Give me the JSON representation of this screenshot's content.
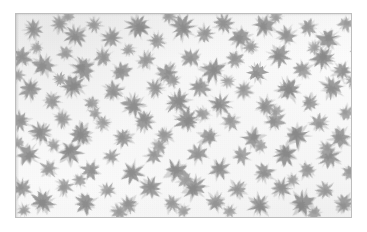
{
  "image": {
    "kind": "micrograph",
    "modality": "brightfield-light-microscopy",
    "color_mode": "grayscale",
    "alt_text": "Grayscale micrograph showing numerous scattered stellate, spiky-edged cells on a pale background",
    "width_px": 367,
    "height_px": 232
  },
  "frame": {
    "border_color": "#bdbdbd",
    "margin_color": "#ffffff",
    "left_px": 15,
    "top_px": 13,
    "width_px": 337,
    "height_px": 205
  },
  "palette": {
    "background": "#fdfdfd",
    "cell_light": "#c9c9c9",
    "cell_mid": "#a8a8a8",
    "cell_dark": "#8d8d8d",
    "cell_core": "#787878",
    "border": "#bdbdbd",
    "paper": "#ffffff"
  },
  "field": {
    "object_label": "cell",
    "object_count": 138,
    "distribution": "scattered",
    "mean_diameter_px": 14,
    "min_diameter_px": 7,
    "max_diameter_px": 24
  },
  "chart_data": {
    "type": "scatter",
    "title": "",
    "xlabel": "",
    "ylabel": "",
    "xlim": [
      0,
      337
    ],
    "ylim": [
      0,
      205
    ],
    "grid": false,
    "legend": "none",
    "series": [
      {
        "name": "cells",
        "marker": "stellate",
        "points": [
          {
            "x": 18,
            "y": 16,
            "r": 10,
            "g": 0.62,
            "rot": 14
          },
          {
            "x": 44,
            "y": 10,
            "r": 9,
            "g": 0.55,
            "rot": 200
          },
          {
            "x": 60,
            "y": 22,
            "r": 11,
            "g": 0.66,
            "rot": 95
          },
          {
            "x": 79,
            "y": 11,
            "r": 8,
            "g": 0.5,
            "rot": 40
          },
          {
            "x": 96,
            "y": 24,
            "r": 10,
            "g": 0.6,
            "rot": 260
          },
          {
            "x": 122,
            "y": 12,
            "r": 12,
            "g": 0.7,
            "rot": 170
          },
          {
            "x": 142,
            "y": 27,
            "r": 9,
            "g": 0.52,
            "rot": 310
          },
          {
            "x": 167,
            "y": 14,
            "r": 12,
            "g": 0.68,
            "rot": 60
          },
          {
            "x": 190,
            "y": 20,
            "r": 9,
            "g": 0.54,
            "rot": 130
          },
          {
            "x": 209,
            "y": 10,
            "r": 10,
            "g": 0.6,
            "rot": 225
          },
          {
            "x": 226,
            "y": 24,
            "r": 11,
            "g": 0.64,
            "rot": 15
          },
          {
            "x": 250,
            "y": 12,
            "r": 11,
            "g": 0.66,
            "rot": 285
          },
          {
            "x": 272,
            "y": 22,
            "r": 10,
            "g": 0.58,
            "rot": 100
          },
          {
            "x": 294,
            "y": 14,
            "r": 9,
            "g": 0.53,
            "rot": 340
          },
          {
            "x": 314,
            "y": 25,
            "r": 11,
            "g": 0.67,
            "rot": 190
          },
          {
            "x": 332,
            "y": 10,
            "r": 8,
            "g": 0.5,
            "rot": 70
          },
          {
            "x": 6,
            "y": 44,
            "r": 10,
            "g": 0.6,
            "rot": 120
          },
          {
            "x": 28,
            "y": 52,
            "r": 11,
            "g": 0.65,
            "rot": 250
          },
          {
            "x": 50,
            "y": 40,
            "r": 8,
            "g": 0.48,
            "rot": 25
          },
          {
            "x": 68,
            "y": 55,
            "r": 12,
            "g": 0.7,
            "rot": 155
          },
          {
            "x": 88,
            "y": 43,
            "r": 9,
            "g": 0.55,
            "rot": 300
          },
          {
            "x": 106,
            "y": 58,
            "r": 10,
            "g": 0.62,
            "rot": 80
          },
          {
            "x": 131,
            "y": 47,
            "r": 9,
            "g": 0.52,
            "rot": 210
          },
          {
            "x": 152,
            "y": 60,
            "r": 11,
            "g": 0.64,
            "rot": 35
          },
          {
            "x": 176,
            "y": 44,
            "r": 10,
            "g": 0.58,
            "rot": 270
          },
          {
            "x": 198,
            "y": 57,
            "r": 12,
            "g": 0.69,
            "rot": 110
          },
          {
            "x": 220,
            "y": 46,
            "r": 9,
            "g": 0.54,
            "rot": 330
          },
          {
            "x": 243,
            "y": 59,
            "r": 10,
            "g": 0.61,
            "rot": 180
          },
          {
            "x": 265,
            "y": 42,
            "r": 11,
            "g": 0.66,
            "rot": 55
          },
          {
            "x": 288,
            "y": 56,
            "r": 9,
            "g": 0.53,
            "rot": 230
          },
          {
            "x": 309,
            "y": 45,
            "r": 12,
            "g": 0.71,
            "rot": 140
          },
          {
            "x": 328,
            "y": 58,
            "r": 10,
            "g": 0.59,
            "rot": 10
          },
          {
            "x": 14,
            "y": 76,
            "r": 11,
            "g": 0.63,
            "rot": 195
          },
          {
            "x": 36,
            "y": 88,
            "r": 9,
            "g": 0.51,
            "rot": 45
          },
          {
            "x": 57,
            "y": 72,
            "r": 12,
            "g": 0.7,
            "rot": 290
          },
          {
            "x": 76,
            "y": 90,
            "r": 8,
            "g": 0.47,
            "rot": 125
          },
          {
            "x": 98,
            "y": 78,
            "r": 10,
            "g": 0.6,
            "rot": 345
          },
          {
            "x": 118,
            "y": 92,
            "r": 11,
            "g": 0.65,
            "rot": 75
          },
          {
            "x": 140,
            "y": 75,
            "r": 9,
            "g": 0.55,
            "rot": 215
          },
          {
            "x": 163,
            "y": 89,
            "r": 12,
            "g": 0.68,
            "rot": 30
          },
          {
            "x": 185,
            "y": 74,
            "r": 10,
            "g": 0.58,
            "rot": 165
          },
          {
            "x": 206,
            "y": 91,
            "r": 11,
            "g": 0.66,
            "rot": 305
          },
          {
            "x": 229,
            "y": 77,
            "r": 9,
            "g": 0.52,
            "rot": 90
          },
          {
            "x": 251,
            "y": 93,
            "r": 10,
            "g": 0.62,
            "rot": 240
          },
          {
            "x": 274,
            "y": 76,
            "r": 12,
            "g": 0.72,
            "rot": 20
          },
          {
            "x": 296,
            "y": 90,
            "r": 9,
            "g": 0.54,
            "rot": 160
          },
          {
            "x": 318,
            "y": 74,
            "r": 11,
            "g": 0.64,
            "rot": 280
          },
          {
            "x": 4,
            "y": 108,
            "r": 10,
            "g": 0.59,
            "rot": 105
          },
          {
            "x": 25,
            "y": 120,
            "r": 11,
            "g": 0.67,
            "rot": 255
          },
          {
            "x": 47,
            "y": 106,
            "r": 9,
            "g": 0.5,
            "rot": 5
          },
          {
            "x": 66,
            "y": 122,
            "r": 12,
            "g": 0.7,
            "rot": 145
          },
          {
            "x": 87,
            "y": 110,
            "r": 8,
            "g": 0.46,
            "rot": 295
          },
          {
            "x": 108,
            "y": 125,
            "r": 10,
            "g": 0.61,
            "rot": 65
          },
          {
            "x": 129,
            "y": 108,
            "r": 11,
            "g": 0.64,
            "rot": 205
          },
          {
            "x": 150,
            "y": 123,
            "r": 9,
            "g": 0.53,
            "rot": 350
          },
          {
            "x": 172,
            "y": 107,
            "r": 12,
            "g": 0.69,
            "rot": 115
          },
          {
            "x": 194,
            "y": 124,
            "r": 10,
            "g": 0.58,
            "rot": 235
          },
          {
            "x": 216,
            "y": 109,
            "r": 9,
            "g": 0.51,
            "rot": 50
          },
          {
            "x": 238,
            "y": 126,
            "r": 11,
            "g": 0.66,
            "rot": 185
          },
          {
            "x": 260,
            "y": 108,
            "r": 10,
            "g": 0.6,
            "rot": 325
          },
          {
            "x": 283,
            "y": 123,
            "r": 12,
            "g": 0.71,
            "rot": 85
          },
          {
            "x": 305,
            "y": 110,
            "r": 9,
            "g": 0.55,
            "rot": 220
          },
          {
            "x": 326,
            "y": 125,
            "r": 11,
            "g": 0.63,
            "rot": 40
          },
          {
            "x": 12,
            "y": 142,
            "r": 11,
            "g": 0.65,
            "rot": 175
          },
          {
            "x": 33,
            "y": 156,
            "r": 9,
            "g": 0.52,
            "rot": 310
          },
          {
            "x": 55,
            "y": 140,
            "r": 12,
            "g": 0.7,
            "rot": 95
          },
          {
            "x": 75,
            "y": 158,
            "r": 10,
            "g": 0.6,
            "rot": 245
          },
          {
            "x": 96,
            "y": 144,
            "r": 8,
            "g": 0.48,
            "rot": 30
          },
          {
            "x": 117,
            "y": 160,
            "r": 11,
            "g": 0.66,
            "rot": 150
          },
          {
            "x": 139,
            "y": 143,
            "r": 9,
            "g": 0.54,
            "rot": 275
          },
          {
            "x": 161,
            "y": 159,
            "r": 12,
            "g": 0.68,
            "rot": 60
          },
          {
            "x": 183,
            "y": 141,
            "r": 10,
            "g": 0.58,
            "rot": 200
          },
          {
            "x": 205,
            "y": 157,
            "r": 11,
            "g": 0.64,
            "rot": 335
          },
          {
            "x": 227,
            "y": 143,
            "r": 9,
            "g": 0.51,
            "rot": 120
          },
          {
            "x": 249,
            "y": 160,
            "r": 10,
            "g": 0.62,
            "rot": 260
          },
          {
            "x": 271,
            "y": 142,
            "r": 12,
            "g": 0.72,
            "rot": 15
          },
          {
            "x": 293,
            "y": 158,
            "r": 9,
            "g": 0.53,
            "rot": 170
          },
          {
            "x": 315,
            "y": 144,
            "r": 11,
            "g": 0.65,
            "rot": 300
          },
          {
            "x": 6,
            "y": 176,
            "r": 10,
            "g": 0.61,
            "rot": 70
          },
          {
            "x": 27,
            "y": 190,
            "r": 12,
            "g": 0.7,
            "rot": 210
          },
          {
            "x": 49,
            "y": 174,
            "r": 9,
            "g": 0.5,
            "rot": 345
          },
          {
            "x": 70,
            "y": 191,
            "r": 11,
            "g": 0.67,
            "rot": 130
          },
          {
            "x": 92,
            "y": 178,
            "r": 8,
            "g": 0.47,
            "rot": 265
          },
          {
            "x": 113,
            "y": 193,
            "r": 10,
            "g": 0.59,
            "rot": 45
          },
          {
            "x": 135,
            "y": 176,
            "r": 11,
            "g": 0.64,
            "rot": 185
          },
          {
            "x": 157,
            "y": 192,
            "r": 9,
            "g": 0.52,
            "rot": 320
          },
          {
            "x": 179,
            "y": 175,
            "r": 12,
            "g": 0.69,
            "rot": 100
          },
          {
            "x": 201,
            "y": 190,
            "r": 10,
            "g": 0.58,
            "rot": 230
          },
          {
            "x": 223,
            "y": 177,
            "r": 9,
            "g": 0.54,
            "rot": 25
          },
          {
            "x": 245,
            "y": 193,
            "r": 11,
            "g": 0.66,
            "rot": 160
          },
          {
            "x": 267,
            "y": 176,
            "r": 10,
            "g": 0.6,
            "rot": 290
          },
          {
            "x": 289,
            "y": 191,
            "r": 12,
            "g": 0.71,
            "rot": 80
          },
          {
            "x": 311,
            "y": 178,
            "r": 9,
            "g": 0.53,
            "rot": 215
          },
          {
            "x": 330,
            "y": 192,
            "r": 10,
            "g": 0.62,
            "rot": 355
          },
          {
            "x": 21,
            "y": 34,
            "r": 7,
            "g": 0.44,
            "rot": 60
          },
          {
            "x": 113,
            "y": 36,
            "r": 7,
            "g": 0.45,
            "rot": 240
          },
          {
            "x": 236,
            "y": 33,
            "r": 8,
            "g": 0.49,
            "rot": 135
          },
          {
            "x": 300,
            "y": 34,
            "r": 7,
            "g": 0.43,
            "rot": 20
          },
          {
            "x": 44,
            "y": 66,
            "r": 7,
            "g": 0.46,
            "rot": 180
          },
          {
            "x": 158,
            "y": 67,
            "r": 8,
            "g": 0.48,
            "rot": 280
          },
          {
            "x": 213,
            "y": 68,
            "r": 7,
            "g": 0.42,
            "rot": 95
          },
          {
            "x": 339,
            "y": 67,
            "r": 8,
            "g": 0.5,
            "rot": 320
          },
          {
            "x": 80,
            "y": 100,
            "r": 7,
            "g": 0.45,
            "rot": 50
          },
          {
            "x": 188,
            "y": 101,
            "r": 8,
            "g": 0.47,
            "rot": 205
          },
          {
            "x": 262,
            "y": 99,
            "r": 7,
            "g": 0.43,
            "rot": 145
          },
          {
            "x": 332,
            "y": 100,
            "r": 8,
            "g": 0.49,
            "rot": 10
          },
          {
            "x": 38,
            "y": 132,
            "r": 7,
            "g": 0.44,
            "rot": 265
          },
          {
            "x": 144,
            "y": 134,
            "r": 8,
            "g": 0.48,
            "rot": 110
          },
          {
            "x": 246,
            "y": 133,
            "r": 7,
            "g": 0.42,
            "rot": 330
          },
          {
            "x": 312,
            "y": 135,
            "r": 8,
            "g": 0.5,
            "rot": 175
          },
          {
            "x": 64,
            "y": 168,
            "r": 7,
            "g": 0.46,
            "rot": 85
          },
          {
            "x": 170,
            "y": 167,
            "r": 8,
            "g": 0.47,
            "rot": 225
          },
          {
            "x": 278,
            "y": 168,
            "r": 7,
            "g": 0.44,
            "rot": 35
          },
          {
            "x": 104,
            "y": 200,
            "r": 8,
            "g": 0.49,
            "rot": 155
          },
          {
            "x": 215,
            "y": 199,
            "r": 7,
            "g": 0.43,
            "rot": 295
          },
          {
            "x": 300,
            "y": 201,
            "r": 8,
            "g": 0.48,
            "rot": 65
          },
          {
            "x": 8,
            "y": 198,
            "r": 7,
            "g": 0.45,
            "rot": 250
          },
          {
            "x": 168,
            "y": 199,
            "r": 7,
            "g": 0.42,
            "rot": 120
          },
          {
            "x": 336,
            "y": 160,
            "r": 8,
            "g": 0.5,
            "rot": 300
          },
          {
            "x": 2,
            "y": 130,
            "r": 7,
            "g": 0.44,
            "rot": 75
          },
          {
            "x": 2,
            "y": 62,
            "r": 7,
            "g": 0.43,
            "rot": 195
          },
          {
            "x": 344,
            "y": 118,
            "r": 7,
            "g": 0.45,
            "rot": 25
          },
          {
            "x": 345,
            "y": 36,
            "r": 8,
            "g": 0.48,
            "rot": 165
          },
          {
            "x": 154,
            "y": 2,
            "r": 8,
            "g": 0.47,
            "rot": 285
          },
          {
            "x": 261,
            "y": 3,
            "r": 7,
            "g": 0.44,
            "rot": 55
          },
          {
            "x": 52,
            "y": 2,
            "r": 7,
            "g": 0.43,
            "rot": 215
          }
        ]
      }
    ]
  }
}
